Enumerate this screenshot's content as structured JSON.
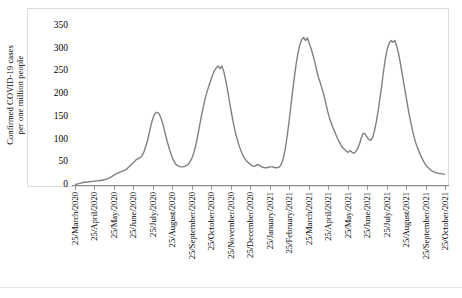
{
  "chart_data": {
    "type": "line",
    "title": "",
    "subtitle": "",
    "xlabel": "",
    "ylabel": "Confirmed COVID-19 cases per one million people",
    "ylabel_line1": "Confirmed COVID-19 cases",
    "ylabel_line2": "per one million people",
    "ylim": [
      0,
      350
    ],
    "y_ticks": [
      0,
      50,
      100,
      150,
      200,
      250,
      300,
      350
    ],
    "y_tick_labels": [
      "0",
      "50",
      "100",
      "150",
      "200",
      "250",
      "300",
      "350"
    ],
    "grid": false,
    "legend": "none",
    "series_color": "#808080",
    "line_width": 1.4,
    "x_tick_labels": [
      "25/March/2020",
      "25/April/2020",
      "25/May/2020",
      "25/June/2020",
      "25/July/2020",
      "25/August/2020",
      "25/September/2020",
      "25/October/2020",
      "25/November/2020",
      "25/December/2020",
      "25/January/2021",
      "25/February/2021",
      "25/March/2021",
      "25/April/2021",
      "25/May/2021",
      "25/June/2021",
      "25/July/2021",
      "25/August/2021",
      "25/September/2021",
      "25/October/2021"
    ],
    "series": [
      {
        "name": "Confirmed COVID-19 cases per one million people",
        "color": "#808080",
        "x_start_label": "25/March/2020",
        "x_end_label": "25/October/2021",
        "sample_interval": "approximately every 6 days",
        "values": [
          1,
          2,
          3,
          4,
          5,
          6,
          6,
          7,
          7,
          8,
          8,
          9,
          9,
          10,
          10,
          11,
          12,
          13,
          15,
          17,
          19,
          22,
          24,
          26,
          28,
          30,
          31,
          33,
          36,
          40,
          44,
          48,
          52,
          56,
          58,
          60,
          64,
          72,
          84,
          98,
          116,
          134,
          148,
          157,
          160,
          158,
          150,
          138,
          122,
          105,
          90,
          76,
          64,
          54,
          47,
          43,
          41,
          40,
          40,
          41,
          43,
          46,
          52,
          60,
          72,
          88,
          108,
          130,
          152,
          172,
          190,
          205,
          218,
          230,
          242,
          252,
          258,
          262,
          256,
          262,
          250,
          232,
          210,
          186,
          162,
          140,
          120,
          104,
          90,
          78,
          68,
          60,
          54,
          50,
          46,
          43,
          41,
          42,
          45,
          44,
          41,
          39,
          38,
          38,
          39,
          40,
          40,
          39,
          38,
          38,
          40,
          46,
          58,
          78,
          104,
          136,
          170,
          205,
          238,
          268,
          292,
          310,
          320,
          325,
          318,
          324,
          312,
          300,
          286,
          270,
          252,
          236,
          224,
          210,
          196,
          178,
          160,
          146,
          134,
          124,
          114,
          104,
          96,
          88,
          82,
          78,
          74,
          72,
          76,
          72,
          70,
          74,
          80,
          90,
          104,
          114,
          112,
          106,
          100,
          98,
          104,
          118,
          138,
          162,
          190,
          220,
          252,
          280,
          300,
          312,
          318,
          314,
          318,
          306,
          290,
          268,
          244,
          220,
          196,
          172,
          150,
          130,
          112,
          96,
          84,
          74,
          64,
          56,
          48,
          42,
          38,
          34,
          31,
          29,
          27,
          26,
          25,
          25,
          24,
          24
        ]
      }
    ]
  },
  "figure": {
    "background": "#ffffff",
    "frame_color": "#dddddd"
  }
}
